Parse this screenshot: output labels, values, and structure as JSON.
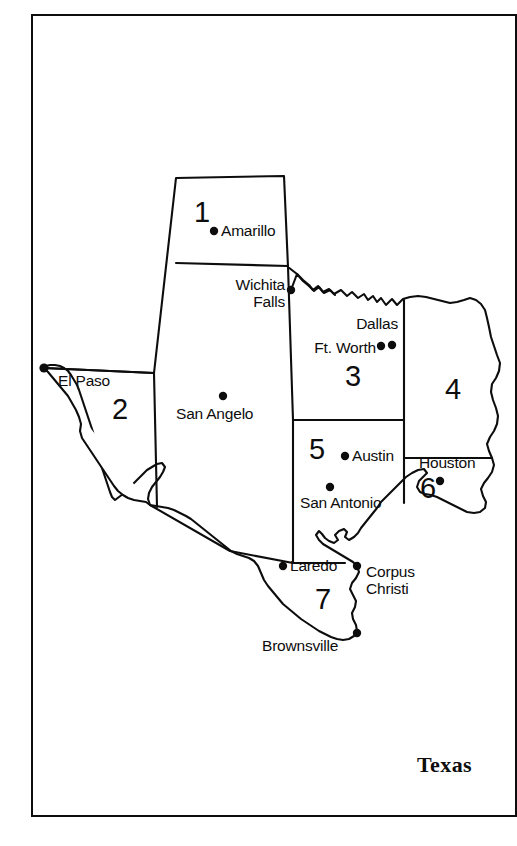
{
  "figure": {
    "title": "Texas",
    "frame_color": "#0d0d0d",
    "background_color": "#ffffff",
    "ink_color": "#0d0d0d"
  },
  "map": {
    "state": "Texas",
    "regions": [
      {
        "id": "1",
        "label": "1",
        "x": 194,
        "y": 198
      },
      {
        "id": "2",
        "label": "2",
        "x": 112,
        "y": 395
      },
      {
        "id": "3",
        "label": "3",
        "x": 345,
        "y": 362
      },
      {
        "id": "4",
        "label": "4",
        "x": 445,
        "y": 375
      },
      {
        "id": "5",
        "label": "5",
        "x": 309,
        "y": 435
      },
      {
        "id": "6",
        "label": "6",
        "x": 420,
        "y": 474
      },
      {
        "id": "7",
        "label": "7",
        "x": 315,
        "y": 585
      }
    ],
    "cities": [
      {
        "name": "Amarillo",
        "dot_x": 214,
        "dot_y": 231,
        "label_x": 221,
        "label_y": 222,
        "align": "left"
      },
      {
        "name": "Wichita\nFalls",
        "dot_x": 291,
        "dot_y": 290,
        "label_x": 285,
        "label_y": 275,
        "align": "right"
      },
      {
        "name": "Dallas",
        "dot_x": 392,
        "dot_y": 345,
        "label_x": 398,
        "label_y": 313,
        "align": "right"
      },
      {
        "name": "Ft. Worth",
        "dot_x": 382,
        "dot_y": 346,
        "label_x": 376,
        "label_y": 341,
        "align": "right"
      },
      {
        "name": "El Paso",
        "dot_x": 44,
        "dot_y": 368,
        "label_x": 58,
        "label_y": 371,
        "align": "left"
      },
      {
        "name": "San Angelo",
        "dot_x": 223,
        "dot_y": 396,
        "label_x": 176,
        "label_y": 405,
        "align": "left"
      },
      {
        "name": "Austin",
        "dot_x": 345,
        "dot_y": 456,
        "label_x": 352,
        "label_y": 447,
        "align": "left"
      },
      {
        "name": "Houston",
        "dot_x": 440,
        "dot_y": 481,
        "label_x": 419,
        "label_y": 452,
        "align": "left"
      },
      {
        "name": "San Antonio",
        "dot_x": 330,
        "dot_y": 487,
        "label_x": 300,
        "label_y": 494,
        "align": "left"
      },
      {
        "name": "Laredo",
        "dot_x": 283,
        "dot_y": 566,
        "label_x": 290,
        "label_y": 557,
        "align": "left"
      },
      {
        "name": "Corpus\nChristi",
        "dot_x": 357,
        "dot_y": 566,
        "label_x": 366,
        "label_y": 563,
        "align": "left"
      },
      {
        "name": "Brownsville",
        "dot_x": 357,
        "dot_y": 633,
        "label_x": 262,
        "label_y": 637,
        "align": "left"
      }
    ]
  }
}
